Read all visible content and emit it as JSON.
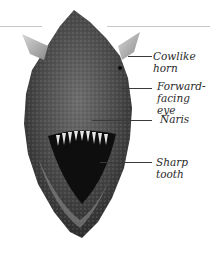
{
  "figure": {
    "labels": [
      {
        "id": "cowlike-horn",
        "text": "Cowlike\nhorn"
      },
      {
        "id": "forward-facing-eye",
        "text": "Forward-\nfacing eye"
      },
      {
        "id": "naris",
        "text": "Naris"
      },
      {
        "id": "sharp-tooth",
        "text": "Sharp\ntooth"
      }
    ]
  }
}
